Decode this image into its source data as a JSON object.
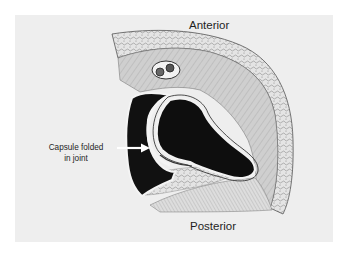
{
  "figure": {
    "background_color": "#eeeeee",
    "page_color": "#ffffff",
    "labels": {
      "top": "Anterior",
      "bottom": "Posterior",
      "callout_line1": "Capsule folded",
      "callout_line2": "in joint"
    },
    "callout_arrow": {
      "color": "#ffffff",
      "points_to": "folded capsule"
    },
    "colors": {
      "bone": "#111111",
      "cartilage": "#f4f4f4",
      "soft_tissue": "#d6d6d6",
      "outline": "#444444"
    }
  }
}
